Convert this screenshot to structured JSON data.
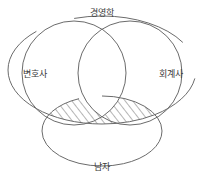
{
  "diagram": {
    "type": "venn",
    "title": "",
    "stroke_color": "#6b6b6b",
    "hatch_color": "#6b6b6b",
    "background_color": "#ffffff",
    "text_color": "#3a3a3a",
    "sets": [
      {
        "id": "business",
        "label": "경영학",
        "shape": "ellipse",
        "role": "universe-outer",
        "label_position": "top",
        "label_breaks_outline": true
      },
      {
        "id": "lawyer",
        "label": "변호사",
        "shape": "circle",
        "role": "left",
        "label_position": "left-inside",
        "label_breaks_outline": false
      },
      {
        "id": "accountant",
        "label": "회계사",
        "shape": "circle",
        "role": "right",
        "label_position": "right-inside",
        "label_breaks_outline": false
      },
      {
        "id": "male",
        "label": "남자",
        "shape": "ellipse",
        "role": "bottom",
        "label_position": "bottom",
        "label_breaks_outline": true
      }
    ],
    "shaded_region": {
      "pattern": "diagonal-hatch",
      "description": "male ∩ business, minus (lawyer ∩ accountant)"
    }
  }
}
